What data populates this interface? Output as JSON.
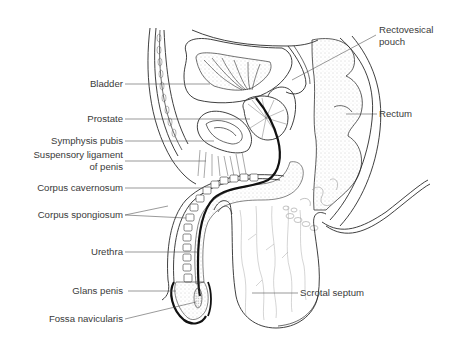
{
  "diagram": {
    "labels": {
      "bladder": "Bladder",
      "prostate": "Prostate",
      "symphysis_pubis": "Symphysis pubis",
      "suspensory_ligament_l1": "Suspensory ligament",
      "suspensory_ligament_l2": "of penis",
      "corpus_cavernosum": "Corpus cavernosum",
      "corpus_spongiosum": "Corpus spongiosum",
      "urethra": "Urethra",
      "glans_penis": "Glans penis",
      "fossa_navicularis": "Fossa navicularis",
      "rectovesical_pouch_l1": "Rectovesical",
      "rectovesical_pouch_l2": "pouch",
      "rectum": "Rectum",
      "scrotal_septum": "Scrotal septum"
    },
    "colors": {
      "line": "#2a2a2a",
      "label_text": "#3a3a3a",
      "leader_line": "#555555",
      "stipple": "#9a9a9a",
      "background": "#ffffff"
    }
  }
}
